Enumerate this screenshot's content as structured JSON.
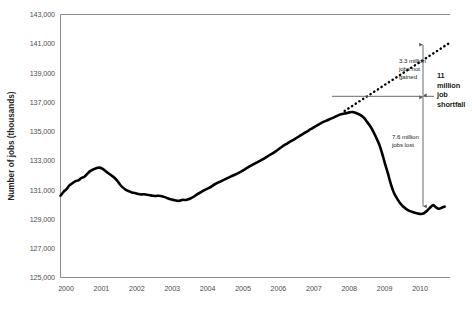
{
  "chart_data": {
    "type": "line",
    "title": "",
    "xlabel": "",
    "ylabel": "Number of jobs (thousands)",
    "ylim": [
      125000,
      143000
    ],
    "ytick_step": 2000,
    "xlim": [
      2000.0,
      2010.9
    ],
    "grid": false,
    "legend": "none",
    "ytick_labels": [
      "143,000",
      "141,000",
      "139,000",
      "137,000",
      "135,000",
      "133,000",
      "131,000",
      "129,000",
      "127,000",
      "125,000"
    ],
    "ytick_values": [
      143000,
      141000,
      139000,
      137000,
      135000,
      133000,
      131000,
      129000,
      127000,
      125000
    ],
    "xtick_labels": [
      "2000",
      "2001",
      "2002",
      "2003",
      "2004",
      "2005",
      "2006",
      "2007",
      "2008",
      "2009",
      "2010"
    ],
    "xtick_values": [
      2000,
      2001,
      2002,
      2003,
      2004,
      2005,
      2006,
      2007,
      2008,
      2009,
      2010
    ],
    "series": [
      {
        "name": "Total nonfarm employment",
        "style": "solid",
        "color": "#000000",
        "x": [
          2000.0,
          2000.08,
          2000.17,
          2000.25,
          2000.33,
          2000.42,
          2000.5,
          2000.58,
          2000.67,
          2000.75,
          2000.83,
          2000.92,
          2001.0,
          2001.08,
          2001.17,
          2001.25,
          2001.33,
          2001.42,
          2001.5,
          2001.58,
          2001.67,
          2001.75,
          2001.83,
          2001.92,
          2002.0,
          2002.08,
          2002.17,
          2002.25,
          2002.33,
          2002.42,
          2002.5,
          2002.58,
          2002.67,
          2002.75,
          2002.83,
          2002.92,
          2003.0,
          2003.08,
          2003.17,
          2003.25,
          2003.33,
          2003.42,
          2003.5,
          2003.58,
          2003.67,
          2003.75,
          2003.83,
          2003.92,
          2004.0,
          2004.17,
          2004.33,
          2004.5,
          2004.67,
          2004.83,
          2005.0,
          2005.17,
          2005.33,
          2005.5,
          2005.67,
          2005.83,
          2006.0,
          2006.17,
          2006.33,
          2006.5,
          2006.67,
          2006.83,
          2007.0,
          2007.17,
          2007.33,
          2007.5,
          2007.67,
          2007.83,
          2008.0,
          2008.08,
          2008.17,
          2008.25,
          2008.33,
          2008.42,
          2008.5,
          2008.58,
          2008.67,
          2008.75,
          2008.83,
          2008.92,
          2009.0,
          2009.08,
          2009.17,
          2009.25,
          2009.33,
          2009.42,
          2009.5,
          2009.58,
          2009.67,
          2009.75,
          2009.83,
          2009.92,
          2010.0,
          2010.08,
          2010.17,
          2010.25,
          2010.33,
          2010.42,
          2010.5,
          2010.58,
          2010.67,
          2010.75
        ],
        "y": [
          130600,
          130850,
          131050,
          131300,
          131450,
          131600,
          131650,
          131800,
          131900,
          132100,
          132280,
          132400,
          132480,
          132520,
          132450,
          132300,
          132150,
          132000,
          131850,
          131650,
          131350,
          131150,
          131000,
          130900,
          130820,
          130780,
          130720,
          130680,
          130700,
          130660,
          130630,
          130600,
          130580,
          130600,
          130560,
          130500,
          130420,
          130350,
          130300,
          130260,
          130250,
          130320,
          130300,
          130350,
          130450,
          130560,
          130700,
          130820,
          130950,
          131150,
          131400,
          131600,
          131800,
          131980,
          132180,
          132420,
          132650,
          132880,
          133100,
          133350,
          133600,
          133900,
          134150,
          134400,
          134650,
          134900,
          135150,
          135400,
          135620,
          135800,
          135980,
          136150,
          136250,
          136300,
          136330,
          136280,
          136200,
          136080,
          135900,
          135650,
          135350,
          135000,
          134600,
          134100,
          133500,
          132800,
          132050,
          131350,
          130800,
          130400,
          130100,
          129880,
          129700,
          129580,
          129500,
          129430,
          129380,
          129350,
          129400,
          129550,
          129750,
          129950,
          129820,
          129700,
          129780,
          129850
        ]
      },
      {
        "name": "Pre-recession trend (projected)",
        "style": "dotted",
        "color": "#000000",
        "x": [
          2007.95,
          2010.85
        ],
        "y": [
          136400,
          141000
        ]
      }
    ],
    "annotations": [
      {
        "id": "jobs-not-gained",
        "lines": [
          "3.3 million",
          "jobs not",
          "gained"
        ],
        "value": 3300000,
        "units": "jobs",
        "from": 141000,
        "to": 137400,
        "arrow": "double"
      },
      {
        "id": "jobs-lost",
        "lines": [
          "7.6 million",
          "jobs lost"
        ],
        "value": 7600000,
        "units": "jobs",
        "from": 137400,
        "to": 129800,
        "arrow": "double"
      },
      {
        "id": "job-shortfall",
        "lines": [
          "11",
          "million",
          "job",
          "shortfall"
        ],
        "value": 11000000,
        "units": "jobs",
        "from": 141000,
        "to": 129800,
        "arrow": "double"
      }
    ]
  }
}
